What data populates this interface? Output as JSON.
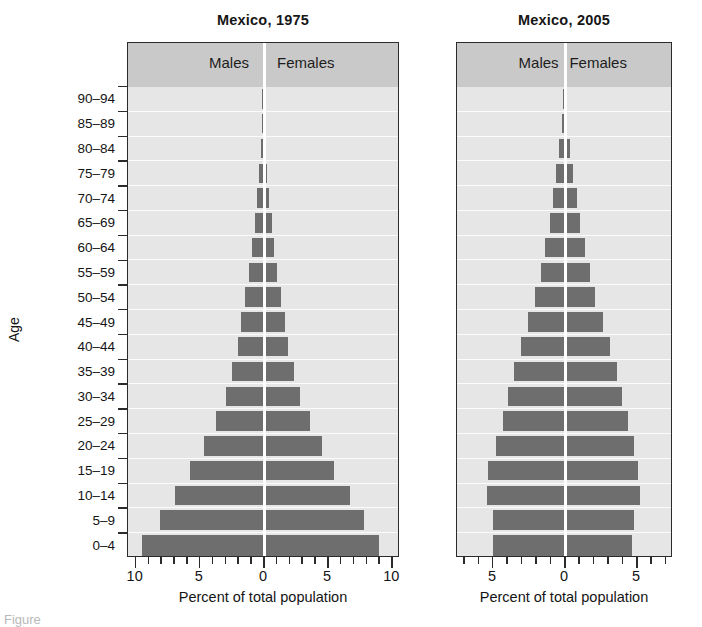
{
  "figure": {
    "caption_fragment": "Figure",
    "bar_color": "#6e6e6e",
    "band_color": "#c9c9c9",
    "plot_background": "#e6e6e6"
  },
  "y_axis": {
    "label": "Age",
    "categories": [
      "0–4",
      "5–9",
      "10–14",
      "15–19",
      "20–24",
      "25–29",
      "30–34",
      "35–39",
      "40–44",
      "45–49",
      "50–54",
      "55–59",
      "60–64",
      "65–69",
      "70–74",
      "75–79",
      "80–84",
      "85–89",
      "90–94"
    ]
  },
  "panels": [
    {
      "title": "Mexico, 1975",
      "male_label": "Males",
      "female_label": "Females",
      "x_title": "Percent of total population",
      "x_tick_labels": [
        "10",
        "5",
        "0",
        "5",
        "10"
      ],
      "x_tick_values": [
        -10,
        -5,
        0,
        5,
        10
      ],
      "x_minor_step": 1,
      "xlim": [
        -10.6,
        10.6
      ]
    },
    {
      "title": "Mexico, 2005",
      "male_label": "Males",
      "female_label": "Females",
      "x_title": "Percent of total population",
      "x_tick_labels": [
        "5",
        "0",
        "5"
      ],
      "x_tick_values": [
        -5,
        0,
        5
      ],
      "x_minor_step": 1,
      "xlim": [
        -7.5,
        7.5
      ]
    }
  ],
  "chart_data": {
    "type": "bar",
    "xlabel": "Percent of total population",
    "ylabel": "Age",
    "grid": true,
    "legend_position": "top-band",
    "categories": [
      "0–4",
      "5–9",
      "10–14",
      "15–19",
      "20–24",
      "25–29",
      "30–34",
      "35–39",
      "40–44",
      "45–49",
      "50–54",
      "55–59",
      "60–64",
      "65–69",
      "70–74",
      "75–79",
      "80–84",
      "85–89",
      "90–94"
    ],
    "charts": [
      {
        "title": "Mexico, 1975",
        "xlim": [
          -10.6,
          10.6
        ],
        "series": [
          {
            "name": "Males",
            "values": [
              9.5,
              8.1,
              6.9,
              5.7,
              4.6,
              3.7,
              2.9,
              2.4,
              2.0,
              1.7,
              1.4,
              1.1,
              0.9,
              0.65,
              0.45,
              0.3,
              0.18,
              0.09,
              0.04
            ]
          },
          {
            "name": "Females",
            "values": [
              9.1,
              7.9,
              6.8,
              5.6,
              4.6,
              3.7,
              2.9,
              2.4,
              2.0,
              1.7,
              1.4,
              1.1,
              0.9,
              0.68,
              0.48,
              0.32,
              0.2,
              0.1,
              0.045
            ]
          }
        ]
      },
      {
        "title": "Mexico, 2005",
        "xlim": [
          -7.5,
          7.5
        ],
        "series": [
          {
            "name": "Males",
            "values": [
              5.0,
              5.0,
              5.4,
              5.3,
              4.8,
              4.3,
              3.9,
              3.5,
              3.0,
              2.5,
              2.0,
              1.6,
              1.3,
              1.0,
              0.8,
              0.55,
              0.35,
              0.17,
              0.07
            ]
          },
          {
            "name": "Females",
            "values": [
              4.8,
              4.9,
              5.3,
              5.2,
              4.9,
              4.5,
              4.1,
              3.7,
              3.2,
              2.7,
              2.2,
              1.8,
              1.45,
              1.15,
              0.9,
              0.62,
              0.4,
              0.2,
              0.08
            ]
          }
        ]
      }
    ]
  }
}
